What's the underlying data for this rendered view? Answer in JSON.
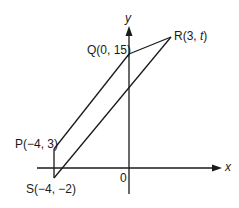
{
  "diagram": {
    "type": "coordinate-geometry",
    "axes": {
      "x_label": "x",
      "y_label": "y",
      "origin_label": "0"
    },
    "points": [
      {
        "name": "P",
        "label": "P(−4, 3)"
      },
      {
        "name": "Q",
        "label": "Q(0, 15)"
      },
      {
        "name": "R",
        "label_prefix": "R(3, ",
        "label_var": "t",
        "label_suffix": ")"
      },
      {
        "name": "S",
        "label": "S(−4, −2)"
      }
    ],
    "shape": "parallelogram PQRS",
    "line_color": "#1a1a1a"
  }
}
